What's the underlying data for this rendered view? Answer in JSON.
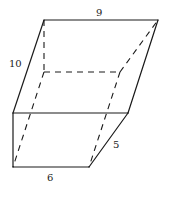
{
  "figure": {
    "type": "oblique prism (parallelepiped) with hidden edges dashed",
    "labels": {
      "top_edge": "9",
      "slant_edge": "10",
      "bottom_edge": "6",
      "depth_edge": "5"
    },
    "colors": {
      "stroke": "#1a1a1a",
      "background": "#ffffff"
    }
  }
}
